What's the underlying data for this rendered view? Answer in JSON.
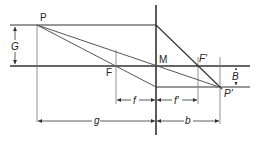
{
  "diagram": {
    "type": "thin-lens-image-construction",
    "labels": {
      "object_point": "P",
      "image_point": "P'",
      "object_height": "G",
      "image_height": "B",
      "focal_point_object": "F",
      "focal_point_image": "F'",
      "lens_center": "M",
      "focal_length_object": "f",
      "focal_length_image": "f'",
      "object_distance": "g",
      "image_distance": "b"
    },
    "colors": {
      "line": "#333333",
      "thin_line": "#777777",
      "text": "#222222"
    }
  }
}
